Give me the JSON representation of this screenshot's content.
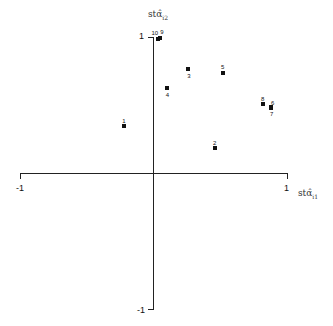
{
  "chart_data": {
    "type": "scatter",
    "title": "",
    "xlabel": "stα̂ᵢ₁",
    "ylabel": "stα̂ᵢ₂",
    "xlabel_base": "stα̂",
    "xlabel_sub": "i1",
    "ylabel_base": "stα̂",
    "ylabel_sub": "i2",
    "xlim": [
      -1,
      1
    ],
    "ylim": [
      -1,
      1
    ],
    "grid": false,
    "legend": null,
    "x_ticks": [
      "-1",
      "1"
    ],
    "y_ticks": [
      "1",
      "-1"
    ],
    "points": [
      {
        "label": "1",
        "x": -0.22,
        "y": 0.35
      },
      {
        "label": "2",
        "x": 0.46,
        "y": 0.19
      },
      {
        "label": "3",
        "x": 0.26,
        "y": 0.77
      },
      {
        "label": "4",
        "x": 0.1,
        "y": 0.63
      },
      {
        "label": "5",
        "x": 0.52,
        "y": 0.74
      },
      {
        "label": "6",
        "x": 0.88,
        "y": 0.49
      },
      {
        "label": "7",
        "x": 0.88,
        "y": 0.48
      },
      {
        "label": "8",
        "x": 0.82,
        "y": 0.51
      },
      {
        "label": "9",
        "x": 0.05,
        "y": 1.0
      },
      {
        "label": "10",
        "x": 0.03,
        "y": 0.99
      }
    ]
  }
}
